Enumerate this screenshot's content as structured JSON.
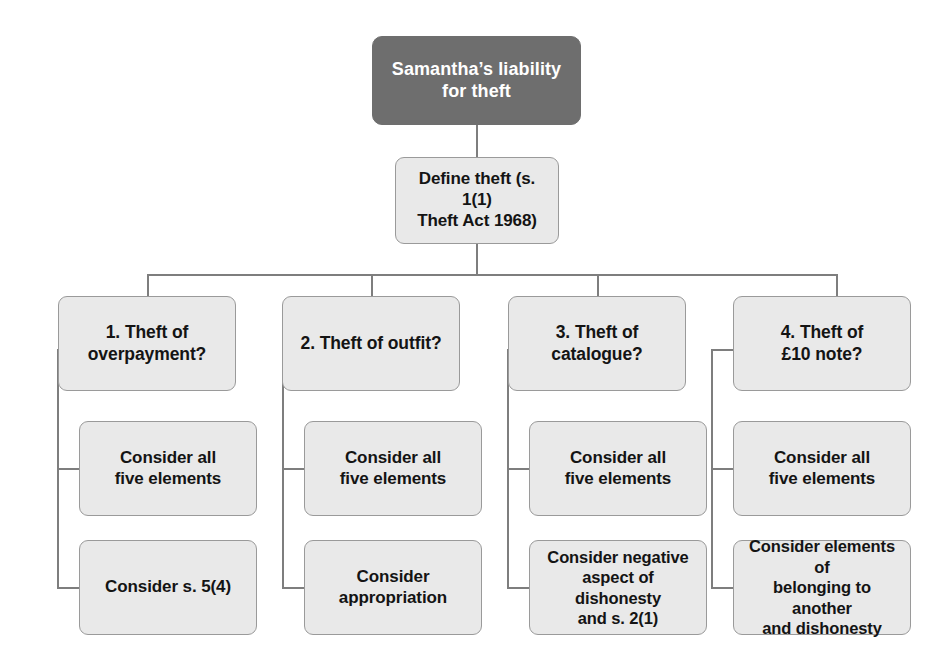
{
  "diagram": {
    "title_node": {
      "text": "Samantha’s liability for theft",
      "line1": "Samantha’s liability",
      "line2": "for theft"
    },
    "define_node": {
      "text": "Define theft (s. 1(1) Theft Act 1968)",
      "line1": "Define theft (s. 1(1)",
      "line2": "Theft Act 1968)"
    },
    "branches": [
      {
        "heading": "1. Theft of overpayment?",
        "heading_line1": "1. Theft of",
        "heading_line2": "overpayment?",
        "steps": [
          {
            "text": "Consider all five elements",
            "line1": "Consider all",
            "line2": "five elements",
            "line3": ""
          },
          {
            "text": "Consider s. 5(4)",
            "line1": "Consider s. 5(4)",
            "line2": "",
            "line3": ""
          }
        ]
      },
      {
        "heading": "2. Theft of outfit?",
        "heading_line1": "2. Theft of outfit?",
        "heading_line2": "",
        "steps": [
          {
            "text": "Consider all five elements",
            "line1": "Consider all",
            "line2": "five elements",
            "line3": ""
          },
          {
            "text": "Consider appropriation",
            "line1": "Consider",
            "line2": "appropriation",
            "line3": ""
          }
        ]
      },
      {
        "heading": "3. Theft of catalogue?",
        "heading_line1": "3. Theft of",
        "heading_line2": "catalogue?",
        "steps": [
          {
            "text": "Consider all five elements",
            "line1": "Consider all",
            "line2": "five elements",
            "line3": ""
          },
          {
            "text": "Consider negative aspect of dishonesty and s. 2(1)",
            "line1": "Consider negative",
            "line2": "aspect of dishonesty",
            "line3": "and s. 2(1)"
          }
        ]
      },
      {
        "heading": "4. Theft of £10 note?",
        "heading_line1": "4. Theft of",
        "heading_line2": "£10 note?",
        "steps": [
          {
            "text": "Consider all five elements",
            "line1": "Consider all",
            "line2": "five elements",
            "line3": ""
          },
          {
            "text": "Consider elements of belonging to another and dishonesty",
            "line1": "Consider elements of",
            "line2": "belonging to another",
            "line3": "and dishonesty"
          }
        ]
      }
    ],
    "colors": {
      "root_fill": "#6e6e6e",
      "root_text": "#ffffff",
      "node_fill": "#e9e9e9",
      "node_border": "#9a9a9a",
      "node_text": "#141414",
      "connector": "#7e7e7e",
      "background": "#ffffff"
    }
  }
}
